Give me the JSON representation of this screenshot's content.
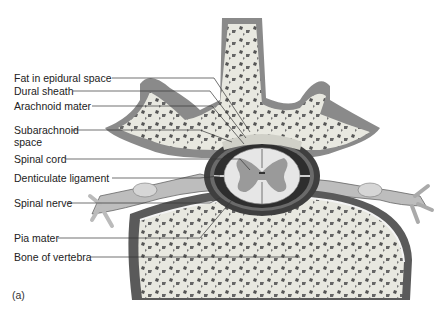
{
  "figure": {
    "panel_label": "(a)",
    "labels": [
      {
        "id": "fat-epidural",
        "text": "Fat in epidural space",
        "x": 14,
        "y": 71
      },
      {
        "id": "dural-sheath",
        "text": "Dural sheath",
        "x": 14,
        "y": 84
      },
      {
        "id": "arachnoid-mater",
        "text": "Arachnoid mater",
        "x": 14,
        "y": 99
      },
      {
        "id": "subarachnoid-space",
        "text": "Subarachnoid",
        "text2": "space",
        "x": 14,
        "y": 124
      },
      {
        "id": "spinal-cord",
        "text": "Spinal cord",
        "x": 14,
        "y": 153
      },
      {
        "id": "denticulate-ligament",
        "text": "Denticulate ligament",
        "x": 14,
        "y": 172
      },
      {
        "id": "spinal-nerve",
        "text": "Spinal nerve",
        "x": 14,
        "y": 196
      },
      {
        "id": "pia-mater",
        "text": "Pia mater",
        "x": 14,
        "y": 232
      },
      {
        "id": "bone-of-vertebra",
        "text": "Bone of vertebra",
        "x": 14,
        "y": 251
      }
    ]
  }
}
